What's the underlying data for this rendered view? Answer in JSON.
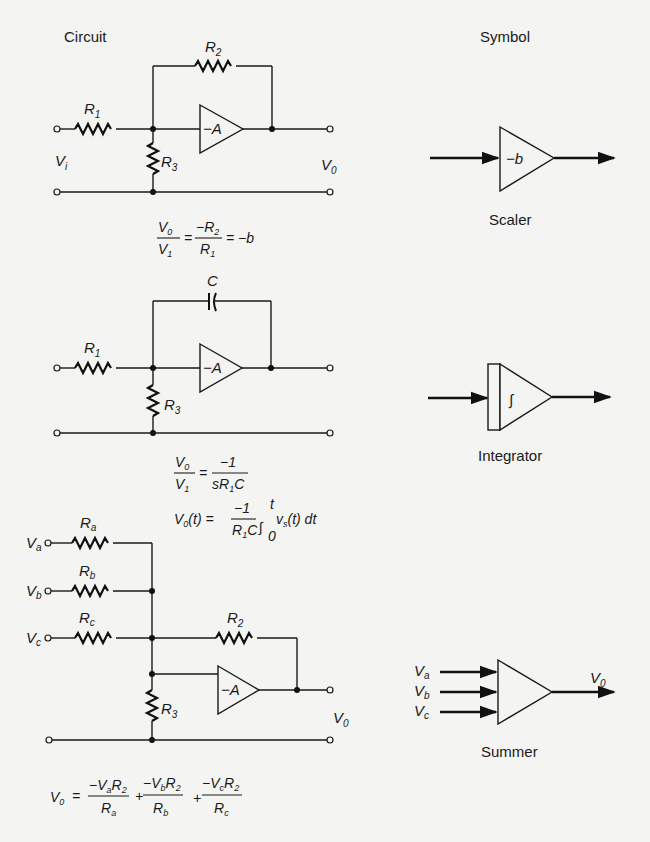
{
  "headings": {
    "circuit": "Circuit",
    "symbol": "Symbol"
  },
  "circuits": [
    {
      "name": "scaler",
      "components": {
        "r1": "R",
        "r1_sub": "1",
        "r2": "R",
        "r2_sub": "2",
        "r3": "R",
        "r3_sub": "3",
        "amp": "−A",
        "vin": "V",
        "vin_sub": "i",
        "vout": "V",
        "vout_sub": "0"
      },
      "equation": {
        "lhs_num": "V",
        "lhs_num_sub": "0",
        "lhs_den": "V",
        "lhs_den_sub": "1",
        "rhs_num": "−R",
        "rhs_num_sub": "2",
        "rhs_den": "R",
        "rhs_den_sub": "1",
        "tail": "= −b"
      },
      "symbol": {
        "label": "−b",
        "caption": "Scaler"
      }
    },
    {
      "name": "integrator",
      "components": {
        "c": "C",
        "r1": "R",
        "r1_sub": "1",
        "r3": "R",
        "r3_sub": "3",
        "amp": "−A"
      },
      "equation1": {
        "lhs_num": "V",
        "lhs_num_sub": "0",
        "lhs_den": "V",
        "lhs_den_sub": "1",
        "rhs_num": "−1",
        "rhs_den_a": "sR",
        "rhs_den_sub": "1",
        "rhs_den_b": "C"
      },
      "equation2": {
        "lhs": "V",
        "lhs_sub": "0",
        "lhs_arg": "(t) =",
        "frac_num": "−1",
        "frac_den_a": "R",
        "frac_den_sub": "1",
        "frac_den_b": "C",
        "integral": "∫",
        "upper": "t",
        "lower": "0",
        "integrand": "v",
        "integrand_sub": "s",
        "integrand_tail": "(t) dt"
      },
      "symbol": {
        "label": "∫",
        "caption": "Integrator"
      }
    },
    {
      "name": "summer",
      "components": {
        "ra": "R",
        "ra_sub": "a",
        "rb": "R",
        "rb_sub": "b",
        "rc": "R",
        "rc_sub": "c",
        "r2": "R",
        "r2_sub": "2",
        "r3": "R",
        "r3_sub": "3",
        "amp": "−A",
        "va": "V",
        "va_sub": "a",
        "vb": "V",
        "vb_sub": "b",
        "vc": "V",
        "vc_sub": "c",
        "vout": "V",
        "vout_sub": "0"
      },
      "equation": {
        "lhs": "V",
        "lhs_sub": "0",
        "eq": "=",
        "t1_num": "−V",
        "t1_num_sub": "a",
        "t1_num_r": "R",
        "t1_num_rsub": "2",
        "t1_den": "R",
        "t1_den_sub": "a",
        "plus1": "+",
        "t2_num": "−V",
        "t2_num_sub": "b",
        "t2_num_r": "R",
        "t2_num_rsub": "2",
        "t2_den": "R",
        "t2_den_sub": "b",
        "plus2": "+",
        "t3_num": "−V",
        "t3_num_sub": "c",
        "t3_num_r": "R",
        "t3_num_rsub": "2",
        "t3_den": "R",
        "t3_den_sub": "c"
      },
      "symbol": {
        "in_a": "V",
        "in_a_sub": "a",
        "in_b": "V",
        "in_b_sub": "b",
        "in_c": "V",
        "in_c_sub": "c",
        "out": "V",
        "out_sub": "0",
        "caption": "Summer"
      }
    }
  ]
}
